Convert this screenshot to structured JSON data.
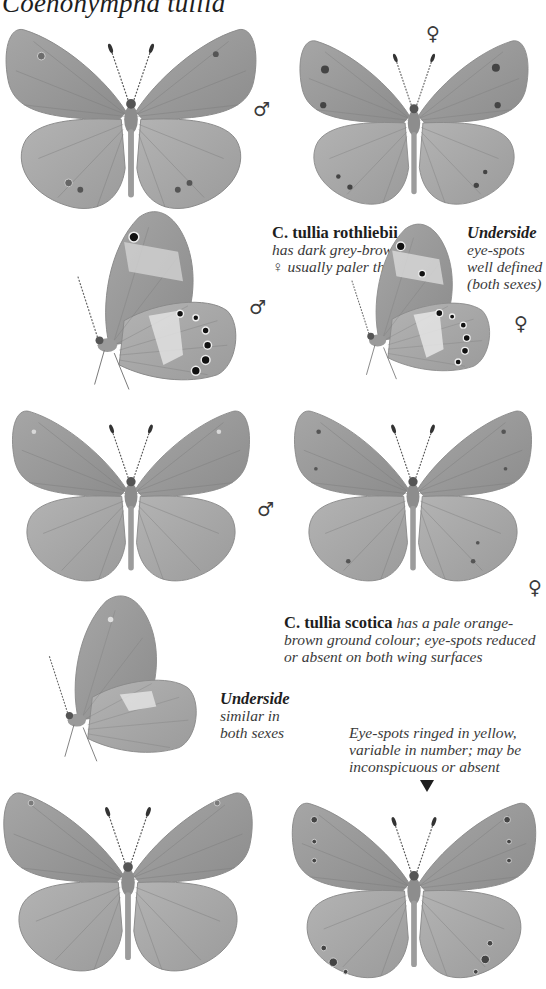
{
  "page": {
    "title": "Coenonympha tullia",
    "colors": {
      "background": "#ffffff",
      "wing": "#9a9a9a",
      "wing_dark": "#7d7d7d",
      "pale_band": "#c9c9c9",
      "text": "#2a2a2a"
    }
  },
  "figures": [
    {
      "id": "fig-1",
      "view": "upperside",
      "sex_symbol": "♂",
      "sex": "male",
      "form": "nominate",
      "eye_spots": "small"
    },
    {
      "id": "fig-2",
      "view": "upperside",
      "sex_symbol": "♀",
      "sex": "female",
      "form": "nominate",
      "eye_spots": "small dark"
    },
    {
      "id": "fig-3",
      "view": "underside",
      "sex_symbol": "♂",
      "sex": "male",
      "form": "rothliebii",
      "eye_spots": "well defined"
    },
    {
      "id": "fig-4",
      "view": "underside",
      "sex_symbol": "♀",
      "sex": "female",
      "form": "rothliebii",
      "eye_spots": "well defined"
    },
    {
      "id": "fig-5",
      "view": "upperside",
      "sex_symbol": "♂",
      "sex": "male",
      "form": "scotica",
      "eye_spots": "reduced"
    },
    {
      "id": "fig-6",
      "view": "upperside",
      "sex_symbol": "♀",
      "sex": "female",
      "form": "scotica",
      "eye_spots": "reduced"
    },
    {
      "id": "fig-7",
      "view": "underside",
      "sex_symbol": "",
      "sex": "both",
      "form": "scotica",
      "eye_spots": "absent"
    },
    {
      "id": "fig-8",
      "view": "upperside",
      "sex_symbol": "",
      "sex": "",
      "form": "variant",
      "eye_spots": "ringed"
    },
    {
      "id": "fig-9",
      "view": "upperside",
      "sex_symbol": "",
      "sex": "",
      "form": "variant",
      "eye_spots": "ringed in yellow"
    }
  ],
  "captions": {
    "rothliebii": {
      "name": "C. tullia rothliebii",
      "line1": "has dark grey-brown wings;",
      "line2_pre": "♀ usually paler than ♂"
    },
    "underside_rothliebii": {
      "heading": "Underside",
      "line1": "eye-spots",
      "line2": "well defined",
      "line3": "(both sexes)"
    },
    "scotica": {
      "name": "C. tullia scotica",
      "line1_rest": "has a pale orange-",
      "line2": "brown ground colour; eye-spots reduced",
      "line3": "or absent on both wing surfaces"
    },
    "underside_scotica": {
      "heading": "Underside",
      "line1": "similar in",
      "line2": "both sexes"
    },
    "eyespots_note": {
      "line1": "Eye-spots ringed in yellow,",
      "line2": "variable in number; may be",
      "line3": "inconspicuous or absent",
      "pointer": "▼"
    }
  }
}
